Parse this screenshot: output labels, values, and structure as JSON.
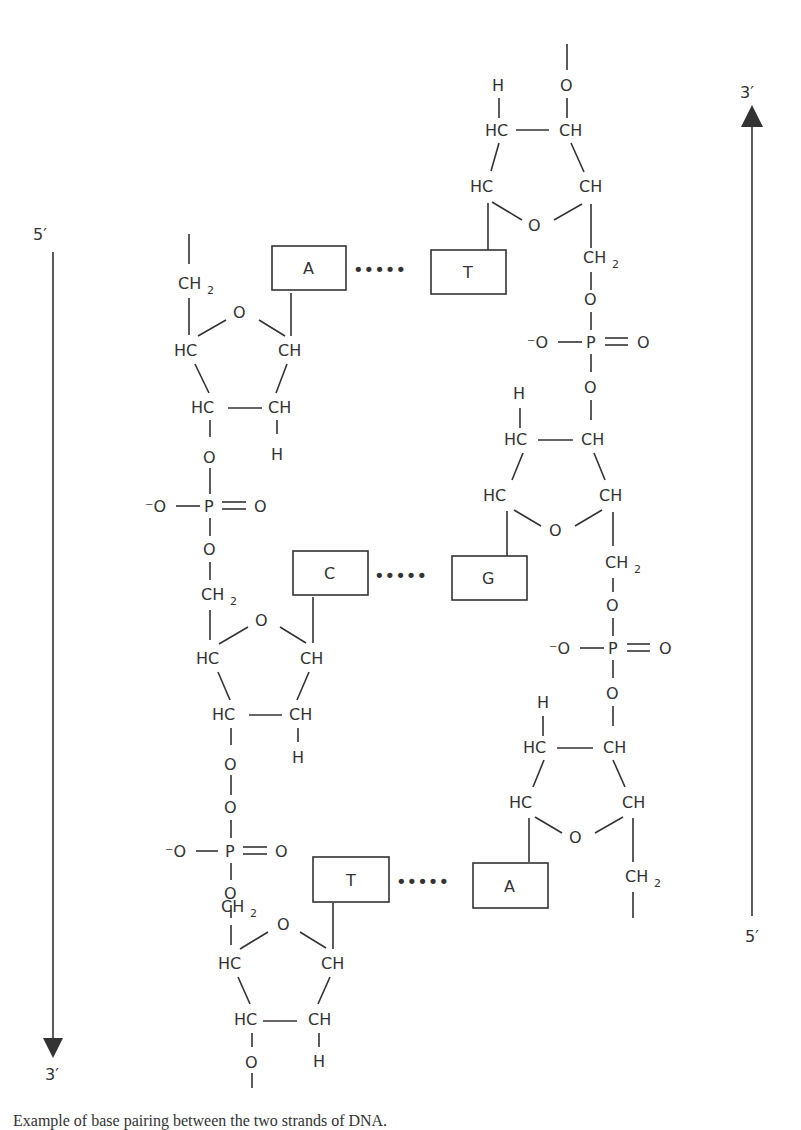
{
  "diagram": {
    "colors": {
      "ink": "#333333",
      "background": "#ffffff"
    },
    "left_strand": {
      "top_label": "5′",
      "bottom_label": "3′",
      "direction": "down"
    },
    "right_strand": {
      "top_label": "3′",
      "bottom_label": "5′",
      "direction": "up"
    },
    "base_pairs": [
      {
        "left": "A",
        "right": "T",
        "bond": "•••••"
      },
      {
        "left": "C",
        "right": "G",
        "bond": "•••••"
      },
      {
        "left": "T",
        "right": "A",
        "bond": "•••••"
      }
    ],
    "atoms": {
      "O": "O",
      "HC": "HC",
      "CH": "CH",
      "H": "H",
      "CH2": "CH",
      "sub2": "2",
      "P": "P",
      "Ominus": "⁻O"
    }
  },
  "caption": "Example of base pairing between the two strands of DNA."
}
